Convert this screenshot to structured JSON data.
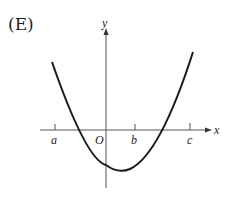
{
  "option_label": "(E)",
  "axes": {
    "x_label": "x",
    "y_label": "y",
    "origin_label": "O"
  },
  "ticks": [
    {
      "label": "a"
    },
    {
      "label": "b"
    },
    {
      "label": "c"
    }
  ],
  "curve": {
    "type": "parabola",
    "opens": "up",
    "description": "Upward parabola crossing x-axis between a and O and between b and c, vertex below x-axis slightly right of O"
  },
  "colors": {
    "curve": "#1a1a1a",
    "axes": "#555555"
  }
}
